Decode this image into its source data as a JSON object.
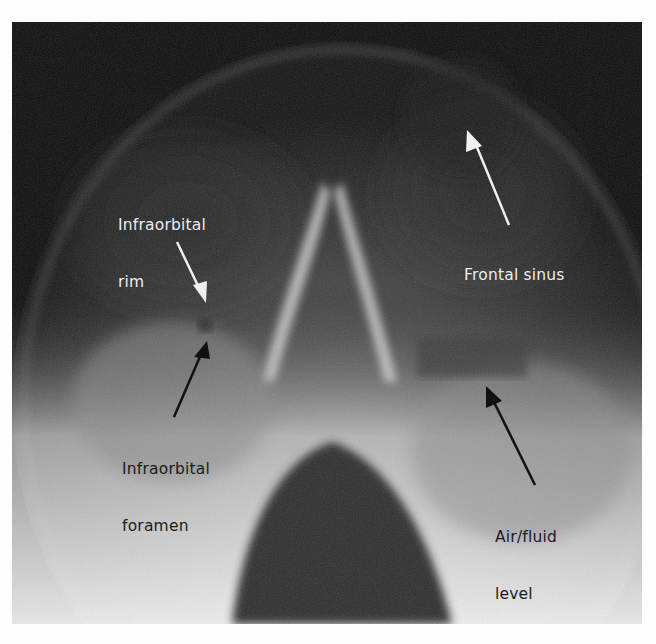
{
  "figure": {
    "labels": [
      {
        "id": "infraorbital-rim",
        "text_lines": [
          "Infraorbital",
          "rim"
        ],
        "tone": "light"
      },
      {
        "id": "frontal-sinus",
        "text_lines": [
          "Frontal sinus"
        ],
        "tone": "light"
      },
      {
        "id": "infraorbital-foramen",
        "text_lines": [
          "Infraorbital",
          "foramen"
        ],
        "tone": "dark"
      },
      {
        "id": "air-fluid-level",
        "text_lines": [
          "Air/fluid",
          "level"
        ],
        "tone": "dark"
      }
    ]
  }
}
